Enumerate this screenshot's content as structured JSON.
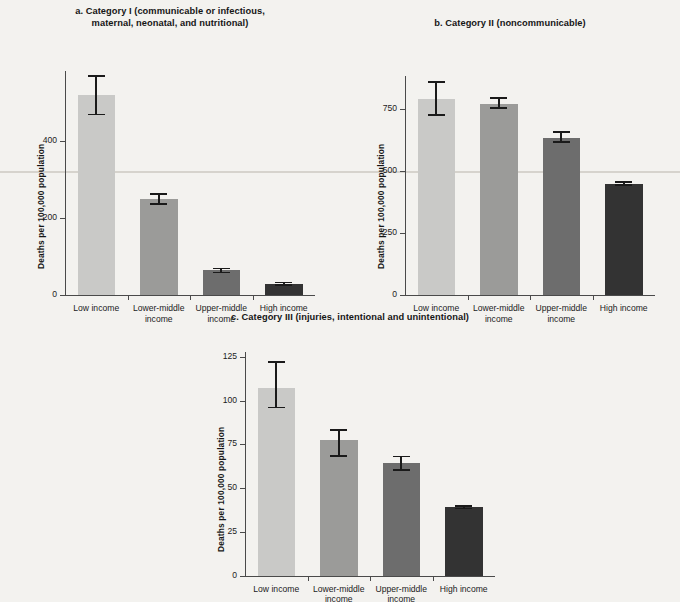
{
  "figure": {
    "ylabel": "Deaths per 100,000 population",
    "categories": [
      "Low income",
      "Lower-middle income",
      "Upper-middle income",
      "High income"
    ],
    "category_lines": [
      [
        "Low income"
      ],
      [
        "Lower-middle",
        "income"
      ],
      [
        "Upper-middle",
        "income"
      ],
      [
        "High income"
      ]
    ],
    "bar_colors": [
      "#c9c9c7",
      "#9b9b99",
      "#6d6d6d",
      "#333333"
    ],
    "axis_color": "#4a4a4a",
    "background": "#f3f2ef"
  },
  "panels": {
    "a": {
      "title_lines": [
        "a. Category I (communicable or infectious,",
        "maternal, neonatal, and nutritional)"
      ],
      "title_full": "a. Category I (communicable or infectious, maternal, neonatal, and nutritional)",
      "ticks": [
        "0",
        "200",
        "400"
      ]
    },
    "b": {
      "title_lines": [
        "b. Category II (noncommunicable)"
      ],
      "title_full": "b. Category II (noncommunicable)",
      "ticks": [
        "0",
        "250",
        "500",
        "750"
      ]
    },
    "c": {
      "title_lines": [
        "c. Category III (injuries, intentional and unintentional)"
      ],
      "title_full": "c. Category III (injuries, intentional and unintentional)",
      "ticks": [
        "0",
        "25",
        "50",
        "75",
        "100",
        "125"
      ]
    }
  },
  "chart_data": [
    {
      "type": "bar",
      "id": "a",
      "title": "a. Category I (communicable or infectious, maternal, neonatal, and nutritional)",
      "xlabel": "",
      "ylabel": "Deaths per 100,000 population",
      "categories": [
        "Low income",
        "Lower-middle income",
        "Upper-middle income",
        "High income"
      ],
      "values": [
        518,
        248,
        64,
        30
      ],
      "error_low": [
        468,
        236,
        59,
        27
      ],
      "error_high": [
        567,
        262,
        69,
        33
      ],
      "ylim": [
        0,
        580
      ],
      "yticks": [
        0,
        200,
        400
      ],
      "grid": false,
      "legend": "none",
      "colors": [
        "#c9c9c7",
        "#9b9b99",
        "#6d6d6d",
        "#333333"
      ]
    },
    {
      "type": "bar",
      "id": "b",
      "title": "b. Category II (noncommunicable)",
      "xlabel": "",
      "ylabel": "Deaths per 100,000 population",
      "categories": [
        "Low income",
        "Lower-middle income",
        "Upper-middle income",
        "High income"
      ],
      "values": [
        788,
        770,
        633,
        448
      ],
      "error_low": [
        723,
        752,
        614,
        443
      ],
      "error_high": [
        858,
        793,
        655,
        454
      ],
      "ylim": [
        0,
        880
      ],
      "yticks": [
        0,
        250,
        500,
        750
      ],
      "grid": false,
      "legend": "none",
      "colors": [
        "#c9c9c7",
        "#9b9b99",
        "#6d6d6d",
        "#333333"
      ]
    },
    {
      "type": "bar",
      "id": "c",
      "title": "c. Category III (injuries, intentional and unintentional)",
      "xlabel": "",
      "ylabel": "Deaths per 100,000 population",
      "categories": [
        "Low income",
        "Lower-middle income",
        "Upper-middle income",
        "High income"
      ],
      "values": [
        107,
        77.5,
        64.5,
        39
      ],
      "error_low": [
        96,
        68.5,
        60.5,
        38.3
      ],
      "error_high": [
        122,
        83,
        68,
        39.8
      ],
      "ylim": [
        0,
        128
      ],
      "yticks": [
        0,
        25,
        50,
        75,
        100,
        125
      ],
      "grid": false,
      "legend": "none",
      "colors": [
        "#c9c9c7",
        "#9b9b99",
        "#6d6d6d",
        "#333333"
      ]
    }
  ]
}
